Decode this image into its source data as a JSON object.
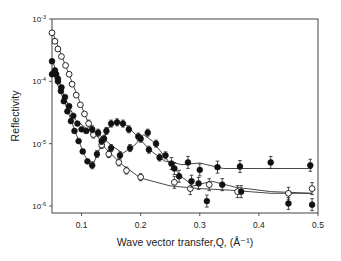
{
  "chart_data": {
    "type": "scatter",
    "title": "",
    "xlabel": "Wave vector transfer,Q, (Å⁻¹)",
    "ylabel": "Reflectivity",
    "xlim": [
      0.05,
      0.5
    ],
    "ylim": [
      1e-06,
      0.001
    ],
    "yscale": "log",
    "grid": false,
    "legend": "none",
    "x_ticks": [
      0.1,
      0.2,
      0.3,
      0.4,
      0.5
    ],
    "x_tick_labels": [
      "0.1",
      "0.2",
      "0.3",
      "0.4",
      "0.5"
    ],
    "y_ticks": [
      0.001,
      0.0001,
      1e-05,
      1e-06
    ],
    "y_tick_labels": [
      "10-3",
      "10-4",
      "10-5",
      "10-6"
    ],
    "series": [
      {
        "name": "open circles",
        "marker": "open-circle",
        "points": [
          [
            0.05,
            0.0006
          ],
          [
            0.055,
            0.00044
          ],
          [
            0.06,
            0.00033
          ],
          [
            0.066,
            0.00025
          ],
          [
            0.073,
            0.00018
          ],
          [
            0.079,
            0.00013
          ],
          [
            0.084,
            9e-05
          ],
          [
            0.091,
            6e-05
          ],
          [
            0.098,
            4.2e-05
          ],
          [
            0.105,
            3e-05
          ],
          [
            0.112,
            2.1e-05
          ],
          [
            0.12,
            1.4e-05
          ],
          [
            0.134,
            9.5e-06
          ],
          [
            0.146,
            6.8e-06
          ],
          [
            0.163,
            5e-06
          ],
          [
            0.176,
            3.7e-06
          ],
          [
            0.2,
            2.9e-06
          ],
          [
            0.257,
            2.4e-06
          ],
          [
            0.284,
            1.9e-06
          ],
          [
            0.316,
            2.2e-06
          ],
          [
            0.364,
            1.7e-06
          ],
          [
            0.45,
            1.6e-06
          ],
          [
            0.49,
            1.9e-06
          ]
        ],
        "fit": [
          [
            0.05,
            0.00065
          ],
          [
            0.08,
            0.00012
          ],
          [
            0.11,
            2.3e-05
          ],
          [
            0.14,
            8.5e-06
          ],
          [
            0.17,
            4.5e-06
          ],
          [
            0.2,
            2.8e-06
          ],
          [
            0.25,
            2.1e-06
          ],
          [
            0.3,
            1.9e-06
          ],
          [
            0.35,
            1.8e-06
          ],
          [
            0.42,
            1.6e-06
          ],
          [
            0.49,
            1.6e-06
          ]
        ]
      },
      {
        "name": "filled circles (dip ~0.12)",
        "marker": "filled-circle",
        "points": [
          [
            0.05,
            0.00013
          ],
          [
            0.054,
            0.00014
          ],
          [
            0.057,
            0.00013
          ],
          [
            0.06,
            0.0001
          ],
          [
            0.065,
            7e-05
          ],
          [
            0.07,
            4.8e-05
          ],
          [
            0.076,
            3.3e-05
          ],
          [
            0.082,
            2.3e-05
          ],
          [
            0.088,
            1.6e-05
          ],
          [
            0.095,
            1.1e-05
          ],
          [
            0.102,
            7.5e-06
          ],
          [
            0.11,
            5.2e-06
          ],
          [
            0.118,
            4.5e-06
          ],
          [
            0.126,
            6.8e-06
          ],
          [
            0.134,
            1.1e-05
          ],
          [
            0.142,
            1.6e-05
          ],
          [
            0.15,
            2.1e-05
          ],
          [
            0.16,
            2.2e-05
          ],
          [
            0.17,
            2.1e-05
          ],
          [
            0.18,
            1.7e-05
          ],
          [
            0.196,
            1.3e-05
          ],
          [
            0.214,
            8e-06
          ],
          [
            0.232,
            6e-06
          ],
          [
            0.252,
            4.8e-06
          ],
          [
            0.28,
            5e-06
          ],
          [
            0.3,
            3.8e-06
          ],
          [
            0.33,
            4.2e-06
          ],
          [
            0.368,
            4.3e-06
          ],
          [
            0.42,
            5e-06
          ],
          [
            0.487,
            4.5e-06
          ]
        ],
        "fit": [
          [
            0.05,
            0.00015
          ],
          [
            0.07,
            5e-05
          ],
          [
            0.09,
            1.5e-05
          ],
          [
            0.105,
            6.5e-06
          ],
          [
            0.118,
            4.3e-06
          ],
          [
            0.13,
            8e-06
          ],
          [
            0.145,
            1.8e-05
          ],
          [
            0.16,
            2.3e-05
          ],
          [
            0.175,
            2e-05
          ],
          [
            0.195,
            1.3e-05
          ],
          [
            0.215,
            8e-06
          ],
          [
            0.24,
            5.3e-06
          ],
          [
            0.27,
            4.6e-06
          ],
          [
            0.3,
            4.9e-06
          ],
          [
            0.34,
            4e-06
          ],
          [
            0.4,
            4e-06
          ],
          [
            0.49,
            4e-06
          ]
        ]
      },
      {
        "name": "filled circles (dip ~0.2)",
        "marker": "filled-circle",
        "points": [
          [
            0.05,
            0.00021
          ],
          [
            0.055,
            0.00015
          ],
          [
            0.06,
            0.00011
          ],
          [
            0.066,
            8e-05
          ],
          [
            0.072,
            5.6e-05
          ],
          [
            0.079,
            4e-05
          ],
          [
            0.086,
            2.8e-05
          ],
          [
            0.093,
            2.1e-05
          ],
          [
            0.1,
            1.7e-05
          ],
          [
            0.108,
            1.6e-05
          ],
          [
            0.118,
            1.7e-05
          ],
          [
            0.128,
            1.5e-05
          ],
          [
            0.138,
            1.2e-05
          ],
          [
            0.15,
            8.5e-06
          ],
          [
            0.165,
            6.5e-06
          ],
          [
            0.182,
            8.5e-06
          ],
          [
            0.2,
            1.2e-05
          ],
          [
            0.212,
            1.5e-05
          ],
          [
            0.226,
            1e-05
          ],
          [
            0.242,
            6.5e-06
          ],
          [
            0.257,
            4e-06
          ],
          [
            0.265,
            3e-06
          ],
          [
            0.286,
            2.5e-06
          ],
          [
            0.298,
            2.3e-06
          ],
          [
            0.312,
            1.2e-06
          ],
          [
            0.338,
            2.2e-06
          ],
          [
            0.37,
            1.7e-06
          ],
          [
            0.45,
            1.1e-06
          ],
          [
            0.49,
            1.05e-06
          ]
        ],
        "fit": [
          [
            0.05,
            0.00023
          ],
          [
            0.07,
            6e-05
          ],
          [
            0.09,
            2.4e-05
          ],
          [
            0.11,
            1.7e-05
          ],
          [
            0.13,
            1.4e-05
          ],
          [
            0.15,
            9.5e-06
          ],
          [
            0.17,
            7e-06
          ],
          [
            0.19,
            9.5e-06
          ],
          [
            0.205,
            1.4e-05
          ],
          [
            0.22,
            1.1e-05
          ],
          [
            0.245,
            5.5e-06
          ],
          [
            0.27,
            2.9e-06
          ],
          [
            0.29,
            2.1e-06
          ],
          [
            0.32,
            2.5e-06
          ],
          [
            0.36,
            2e-06
          ],
          [
            0.42,
            1.7e-06
          ],
          [
            0.49,
            1.6e-06
          ]
        ]
      }
    ]
  }
}
